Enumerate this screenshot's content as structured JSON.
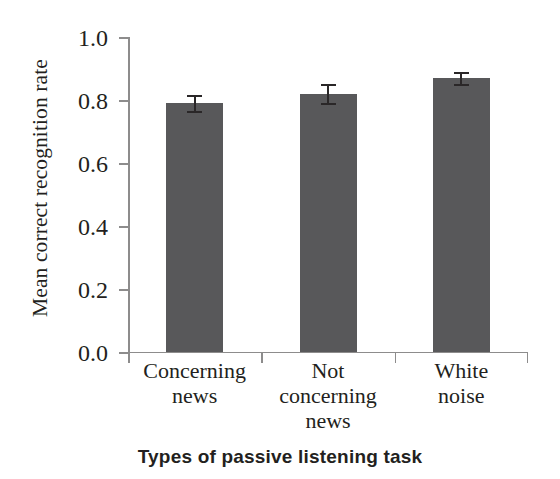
{
  "chart_data": {
    "type": "bar",
    "title": "",
    "xlabel": "Types of passive listening  task",
    "ylabel": "Mean correct recognition rate",
    "categories": [
      "Concerning news",
      "Not concerning news",
      "White noise"
    ],
    "category_lines": [
      [
        "Concerning",
        "news"
      ],
      [
        "Not",
        "concerning",
        "news"
      ],
      [
        "White",
        "noise"
      ]
    ],
    "values": [
      0.79,
      0.82,
      0.87
    ],
    "errors": [
      0.025,
      0.03,
      0.02
    ],
    "ylim": [
      0.0,
      1.0
    ],
    "yticks": [
      0.0,
      0.2,
      0.4,
      0.6,
      0.8,
      1.0
    ],
    "ytick_labels": [
      "0.0",
      "0.2",
      "0.4",
      "0.6",
      "0.8",
      "1.0"
    ],
    "grid": false,
    "legend": null,
    "bar_color": "#58585a",
    "error_color": "#2a2728",
    "axis_color": "#8d8c8c",
    "text_color": "#231f20"
  }
}
